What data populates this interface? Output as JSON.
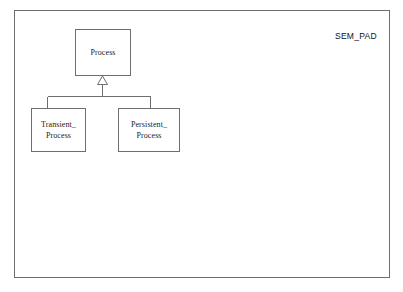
{
  "diagram": {
    "caption": "SEM_PAD",
    "notation": "uml-class-generalization",
    "colors": {
      "background": "#ffffff",
      "line": "#6e6e6e",
      "text": "#1a1a1a",
      "caption_text": "#111111"
    },
    "frame": {
      "name": "diagram-frame"
    },
    "nodes": [
      {
        "id": "process",
        "label": "Process",
        "role": "superclass"
      },
      {
        "id": "transient-process",
        "label": "Transient_\nProcess",
        "role": "subclass"
      },
      {
        "id": "persistent-process",
        "label": "Persistent_\nProcess",
        "role": "subclass"
      }
    ],
    "edges": [
      {
        "id": "gen-transient",
        "from": "transient-process",
        "to": "process",
        "type": "generalization",
        "arrowhead": "hollow-triangle"
      },
      {
        "id": "gen-persistent",
        "from": "persistent-process",
        "to": "process",
        "type": "generalization",
        "arrowhead": "hollow-triangle"
      }
    ]
  }
}
